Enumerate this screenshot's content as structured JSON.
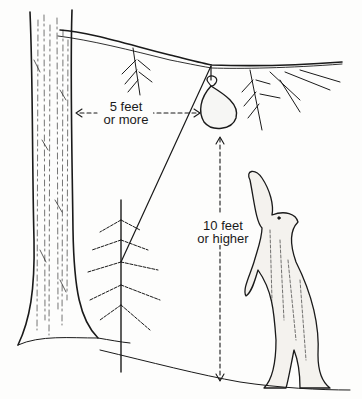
{
  "illustration": {
    "subject": "Hanging food bag out of reach of a standing bear",
    "labels": {
      "horizontal_distance": {
        "line1": "5 feet",
        "line2": "or more"
      },
      "vertical_distance": {
        "line1": "10 feet",
        "line2": "or higher"
      }
    },
    "elements": [
      "large-tree-trunk",
      "overhanging-branch",
      "food-bag",
      "support-rope",
      "young-fir-tree",
      "standing-bear",
      "ground-line"
    ],
    "colors": {
      "ink": "#1a1a1a",
      "paper": "#fdfdfc"
    }
  }
}
